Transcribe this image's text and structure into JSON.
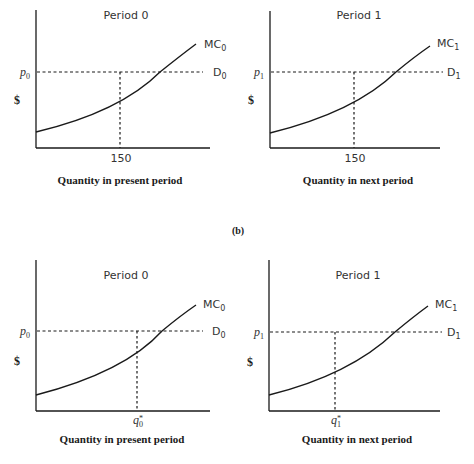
{
  "figure": {
    "section_label": "(b)",
    "y_axis_symbol": "$",
    "panels": [
      {
        "id": "top-left",
        "title": "Period 0",
        "price_label": "p",
        "price_sub": "0",
        "mc_label": "MC",
        "mc_sub": "0",
        "demand_label": "D",
        "demand_sub": "0",
        "q_label": "150",
        "q_sub": "",
        "q_star": "",
        "xlabel": "Quantity in present period"
      },
      {
        "id": "top-right",
        "title": "Period 1",
        "price_label": "p",
        "price_sub": "1",
        "mc_label": "MC",
        "mc_sub": "1",
        "demand_label": "D",
        "demand_sub": "1",
        "q_label": "150",
        "q_sub": "",
        "q_star": "",
        "xlabel": "Quantity in next period"
      },
      {
        "id": "bottom-left",
        "title": "Period 0",
        "price_label": "p",
        "price_sub": "0",
        "mc_label": "MC",
        "mc_sub": "0",
        "demand_label": "D",
        "demand_sub": "0",
        "q_label": "q",
        "q_sub": "0",
        "q_star": "*",
        "xlabel": "Quantity in present period"
      },
      {
        "id": "bottom-right",
        "title": "Period 1",
        "price_label": "p",
        "price_sub": "1",
        "mc_label": "MC",
        "mc_sub": "1",
        "demand_label": "D",
        "demand_sub": "1",
        "q_label": "q",
        "q_sub": "1",
        "q_star": "*",
        "xlabel": "Quantity in next period"
      }
    ],
    "colors": {
      "ink": "#1a1a1a",
      "label": "#333333"
    }
  }
}
